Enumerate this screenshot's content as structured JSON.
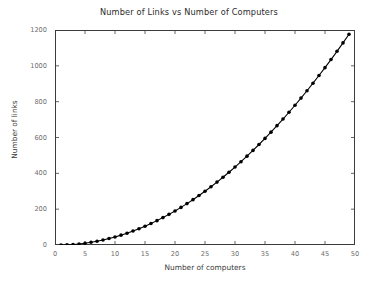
{
  "chart_data": {
    "type": "line",
    "title": "Number of Links vs Number of Computers",
    "xlabel": "Number of computers",
    "ylabel": "Number of links",
    "xlim": [
      0,
      50
    ],
    "ylim": [
      0,
      1200
    ],
    "grid": false,
    "legend": null,
    "marker": "filled-circle",
    "line_color": "#000000",
    "marker_color": "#000000",
    "axis_color": "#3c3c3c",
    "tick_label_color": "#6e6e6e",
    "background_color": "#ffffff",
    "xticks": [
      0,
      5,
      10,
      15,
      20,
      25,
      30,
      35,
      40,
      45,
      50
    ],
    "yticks": [
      0,
      200,
      400,
      600,
      800,
      1000,
      1200
    ],
    "series": [
      {
        "name": "links",
        "x": [
          1,
          2,
          3,
          4,
          5,
          6,
          7,
          8,
          9,
          10,
          11,
          12,
          13,
          14,
          15,
          16,
          17,
          18,
          19,
          20,
          21,
          22,
          23,
          24,
          25,
          26,
          27,
          28,
          29,
          30,
          31,
          32,
          33,
          34,
          35,
          36,
          37,
          38,
          39,
          40,
          41,
          42,
          43,
          44,
          45,
          46,
          47,
          48,
          49,
          50
        ],
        "values": [
          0,
          1,
          3,
          6,
          10,
          15,
          21,
          28,
          36,
          45,
          55,
          66,
          78,
          91,
          105,
          120,
          136,
          153,
          171,
          190,
          210,
          231,
          253,
          276,
          300,
          325,
          351,
          378,
          406,
          435,
          465,
          496,
          528,
          561,
          595,
          630,
          666,
          703,
          741,
          780,
          820,
          861,
          903,
          946,
          990,
          1035,
          1081,
          1128,
          1176,
          1225
        ]
      }
    ]
  }
}
